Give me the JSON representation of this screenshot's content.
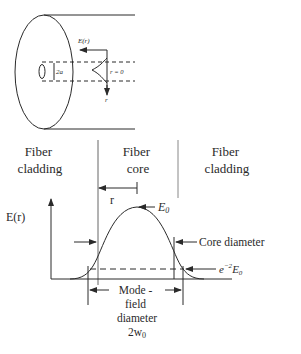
{
  "top_diagram": {
    "field_label": "E(r)",
    "core_label": "2a",
    "axis_label": "r = 0",
    "radial_label": "r"
  },
  "bottom_diagram": {
    "regions": [
      {
        "line1": "Fiber",
        "line2": "cladding"
      },
      {
        "line1": "Fiber",
        "line2": "core"
      },
      {
        "line1": "Fiber",
        "line2": "cladding"
      }
    ],
    "r_label": "r",
    "y_axis_label": "E(r)",
    "peak_label": "E",
    "peak_sub": "0",
    "core_diameter_label": "Core diameter",
    "threshold_label_pre": "e",
    "threshold_label_exp": "−2",
    "threshold_label_E": "E",
    "threshold_label_sub": "0",
    "mfd_lines": [
      "Mode -",
      "field",
      "diameter"
    ],
    "mfd_symbol": "2w",
    "mfd_sub": "0"
  },
  "colors": {
    "ink": "#2a2a2a",
    "background": "#ffffff"
  }
}
